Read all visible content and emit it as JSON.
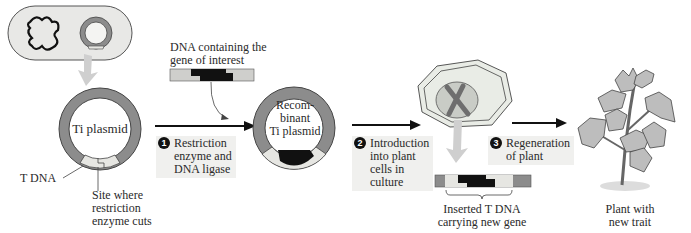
{
  "figure": {
    "labels": {
      "ti_plasmid": "Ti plasmid",
      "t_dna": "T DNA",
      "restriction_site": "Site where\nrestriction\nenzyme cuts",
      "gene_dna": "DNA containing the\ngene of interest",
      "recombinant": "Recom-\nbinant\nTi plasmid",
      "inserted_tdna": "Inserted T DNA\ncarrying new gene",
      "plant": "Plant with\nnew trait"
    },
    "steps": [
      {
        "number": "1",
        "text": "Restriction\nenzyme and\nDNA ligase"
      },
      {
        "number": "2",
        "text": "Introduction\ninto plant\ncells in\nculture"
      },
      {
        "number": "3",
        "text": "Regeneration\nof plant"
      }
    ],
    "colors": {
      "plasmid_ring": "#8c8c8c",
      "tdna_segment": "#e6e6e2",
      "gene_insert": "#111111",
      "cell_fill": "#e9ece6",
      "nucleus_fill": "#c9ccc6",
      "chromosome": "#6e6e6e",
      "guide_arrow": "#cfcfcf",
      "step_box": "#f0f0ee",
      "plant_leaf": "#bdbdbd"
    }
  }
}
